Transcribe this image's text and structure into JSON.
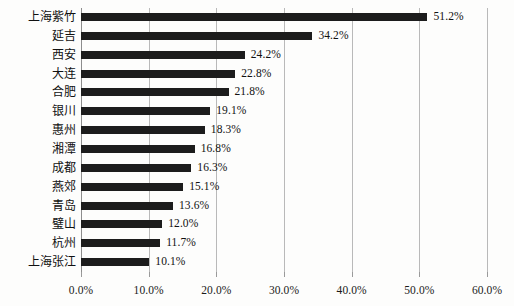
{
  "chart_data": {
    "type": "bar",
    "orientation": "horizontal",
    "title": "",
    "subtitle": "",
    "xlabel": "",
    "ylabel": "",
    "xlim": [
      0,
      60
    ],
    "grid": true,
    "legend": null,
    "legend_position": "none",
    "value_label_suffix": "%",
    "bar_color": "#1c1c1c",
    "gridline_color": "#b9b9b9",
    "background_color": "#fdfdfc",
    "axis_ticks": [
      "0.0%",
      "10.0%",
      "20.0%",
      "30.0%",
      "40.0%",
      "50.0%",
      "60.0%"
    ],
    "axis_tick_values": [
      0,
      10,
      20,
      30,
      40,
      50,
      60
    ],
    "categories": [
      "上海紫竹",
      "延吉",
      "西安",
      "大连",
      "合肥",
      "银川",
      "惠州",
      "湘潭",
      "成都",
      "燕郊",
      "青岛",
      "璧山",
      "杭州",
      "上海张江"
    ],
    "values": [
      51.2,
      34.2,
      24.2,
      22.8,
      21.8,
      19.1,
      18.3,
      16.8,
      16.3,
      15.1,
      13.6,
      12.0,
      11.7,
      10.1
    ],
    "value_labels": [
      "51.2%",
      "34.2%",
      "24.2%",
      "22.8%",
      "21.8%",
      "19.1%",
      "18.3%",
      "16.8%",
      "16.3%",
      "15.1%",
      "13.6%",
      "12.0%",
      "11.7%",
      "10.1%"
    ]
  }
}
